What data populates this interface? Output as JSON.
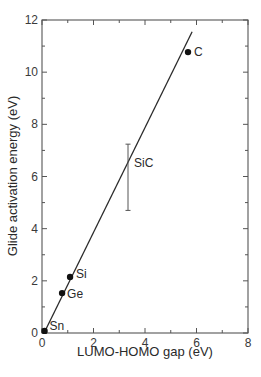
{
  "chart_data": {
    "type": "scatter",
    "title": "",
    "xlabel": "LUMO-HOMO gap (eV)",
    "ylabel": "Glide activation energy (eV)",
    "xlim": [
      0,
      8
    ],
    "ylim": [
      0,
      12
    ],
    "xticks": [
      0,
      2,
      4,
      6,
      8
    ],
    "yticks": [
      0,
      2,
      4,
      6,
      8,
      10,
      12
    ],
    "x_minor_step": 1,
    "y_minor_step": 1,
    "grid": false,
    "legend": null,
    "points": [
      {
        "label": "Sn",
        "x": 0.1,
        "y": 0.08
      },
      {
        "label": "Ge",
        "x": 0.78,
        "y": 1.53
      },
      {
        "label": "Si",
        "x": 1.09,
        "y": 2.15
      },
      {
        "label": "C",
        "x": 5.67,
        "y": 10.77
      }
    ],
    "error_bars": [
      {
        "label": "SiC",
        "x": 3.34,
        "y_low": 4.7,
        "y_high": 7.24
      }
    ],
    "fit_line": {
      "x": [
        0.08,
        5.83
      ],
      "y": [
        0.0,
        11.55
      ]
    }
  }
}
